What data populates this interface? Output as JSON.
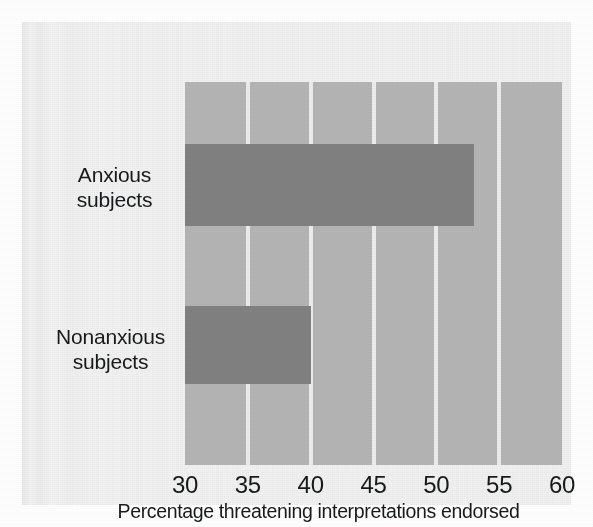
{
  "chart_data": {
    "type": "bar",
    "orientation": "horizontal",
    "title": "",
    "subtitle": "",
    "categories": [
      "Anxious subjects",
      "Nonanxious subjects"
    ],
    "category_lines": [
      [
        "Anxious",
        "subjects"
      ],
      [
        "Nonanxious",
        "subjects"
      ]
    ],
    "values": [
      53,
      40
    ],
    "series": [
      {
        "name": "Percentage threatening interpretations endorsed",
        "values": [
          53,
          40
        ]
      }
    ],
    "xlabel": "Percentage threatening interpretations endorsed",
    "ylabel": "",
    "xlim": [
      30,
      60
    ],
    "xticks": [
      30,
      35,
      40,
      45,
      50,
      55,
      60
    ],
    "xtick_labels": [
      "30",
      "35",
      "40",
      "45",
      "50",
      "55",
      "60"
    ],
    "grid": true,
    "grid_orientation": "vertical",
    "legend": false,
    "legend_position": "none",
    "annotations": [],
    "colors": {
      "bar": "#818181",
      "plot_background": "#b4b4b4",
      "gridline": "#ececed",
      "page_background": "#f0f0f0",
      "text": "#17191a"
    }
  },
  "axis": {
    "ticks": [
      {
        "value": "30"
      },
      {
        "value": "35"
      },
      {
        "value": "40"
      },
      {
        "value": "45"
      },
      {
        "value": "50"
      },
      {
        "value": "55"
      },
      {
        "value": "60"
      }
    ],
    "title": "Percentage threatening interpretations endorsed"
  },
  "categories": [
    {
      "line1": "Anxious",
      "line2": "subjects",
      "value": 53
    },
    {
      "line1": "Nonanxious",
      "line2": "subjects",
      "value": 40
    }
  ]
}
